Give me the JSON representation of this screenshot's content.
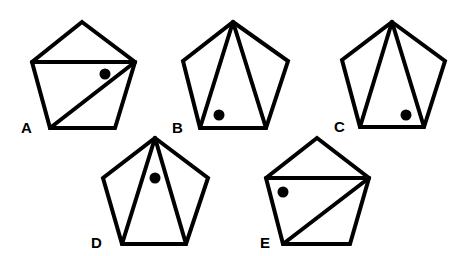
{
  "figure": {
    "options": [
      {
        "label": "A",
        "pentagon": {
          "top": [
            82,
            22
          ],
          "upper_left": [
            32,
            62
          ],
          "upper_right": [
            135,
            62
          ],
          "bottom_left": [
            50,
            128
          ],
          "bottom_right": [
            115,
            128
          ]
        },
        "diagonals": [
          [
            [
              32,
              62
            ],
            [
              135,
              62
            ]
          ],
          [
            [
              135,
              62
            ],
            [
              50,
              128
            ]
          ]
        ],
        "dot": [
          105,
          74
        ],
        "label_pos": [
          21,
          133
        ]
      },
      {
        "label": "B",
        "pentagon": {
          "top": [
            233,
            22
          ],
          "upper_left": [
            183,
            61
          ],
          "upper_right": [
            288,
            61
          ],
          "bottom_left": [
            200,
            128
          ],
          "bottom_right": [
            266,
            128
          ]
        },
        "diagonals": [
          [
            [
              233,
              22
            ],
            [
              200,
              128
            ]
          ],
          [
            [
              233,
              22
            ],
            [
              266,
              128
            ]
          ]
        ],
        "dot": [
          219,
          115
        ],
        "label_pos": [
          172,
          133
        ]
      },
      {
        "label": "C",
        "pentagon": {
          "top": [
            392,
            22
          ],
          "upper_left": [
            342,
            60
          ],
          "upper_right": [
            445,
            61
          ],
          "bottom_left": [
            360,
            127
          ],
          "bottom_right": [
            424,
            127
          ]
        },
        "diagonals": [
          [
            [
              392,
              22
            ],
            [
              360,
              127
            ]
          ],
          [
            [
              392,
              22
            ],
            [
              424,
              127
            ]
          ]
        ],
        "dot": [
          406,
          115
        ],
        "label_pos": [
          334,
          132
        ]
      },
      {
        "label": "D",
        "pentagon": {
          "top": [
            155,
            138
          ],
          "upper_left": [
            103,
            178
          ],
          "upper_right": [
            208,
            178
          ],
          "bottom_left": [
            122,
            244
          ],
          "bottom_right": [
            186,
            244
          ]
        },
        "diagonals": [
          [
            [
              155,
              138
            ],
            [
              122,
              244
            ]
          ],
          [
            [
              155,
              138
            ],
            [
              186,
              244
            ]
          ]
        ],
        "dot": [
          155,
          178
        ],
        "label_pos": [
          91,
          248
        ]
      },
      {
        "label": "E",
        "pentagon": {
          "top": [
            317,
            138
          ],
          "upper_left": [
            266,
            178
          ],
          "upper_right": [
            369,
            178
          ],
          "bottom_left": [
            283,
            244
          ],
          "bottom_right": [
            350,
            244
          ]
        },
        "diagonals": [
          [
            [
              266,
              178
            ],
            [
              369,
              178
            ]
          ],
          [
            [
              369,
              178
            ],
            [
              283,
              244
            ]
          ]
        ],
        "dot": [
          283,
          192
        ],
        "label_pos": [
          260,
          248
        ]
      }
    ]
  }
}
